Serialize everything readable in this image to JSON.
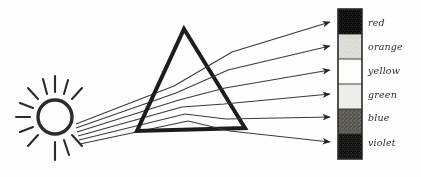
{
  "figure": {
    "background_color": "#fefefe",
    "ink_color": "#2b2b2b",
    "width": 421,
    "height": 177
  },
  "light_source": {
    "name": "sun",
    "center_x": 55,
    "center_y": 117,
    "radius": 17,
    "ray_count": 12
  },
  "prism": {
    "name": "triangular-prism",
    "apex_x": 184,
    "apex_y": 29,
    "base_left_x": 136,
    "base_right_x": 245,
    "base_y": 129
  },
  "incident_beam": {
    "label": "white light",
    "ray_count": 6,
    "origin_x": 80,
    "origin_y_top": 88,
    "origin_y_bottom": 123
  },
  "spectrum_bar": {
    "name": "spectrum-screen",
    "x": 338,
    "y": 9,
    "width": 24,
    "height": 150,
    "band_count": 6
  },
  "chart_data": {
    "type": "bar",
    "xlabel": "",
    "ylabel": "",
    "categories": [
      "red",
      "orange",
      "yellow",
      "green",
      "blue",
      "violet"
    ],
    "values": [
      25,
      25,
      25,
      25,
      25,
      25
    ],
    "legend_position": "right",
    "grid": false,
    "bands": [
      {
        "label": "red",
        "order": 1,
        "tone": "very-dark",
        "fill": "#1f1f1f",
        "stipple_opacity": 0.92,
        "band_top": 9,
        "band_height": 25,
        "arrow_tip_y": 22
      },
      {
        "label": "orange",
        "order": 2,
        "tone": "light",
        "fill": "#e0ddd8",
        "stipple_opacity": 0.35,
        "band_top": 34,
        "band_height": 25,
        "arrow_tip_y": 46
      },
      {
        "label": "yellow",
        "order": 3,
        "tone": "white",
        "fill": "#fdfdfb",
        "stipple_opacity": 0.04,
        "band_top": 59,
        "band_height": 25,
        "arrow_tip_y": 70
      },
      {
        "label": "green",
        "order": 4,
        "tone": "very-light",
        "fill": "#efedea",
        "stipple_opacity": 0.16,
        "band_top": 84,
        "band_height": 25,
        "arrow_tip_y": 94
      },
      {
        "label": "blue",
        "order": 5,
        "tone": "medium-dark",
        "fill": "#6a6660",
        "stipple_opacity": 0.72,
        "band_top": 109,
        "band_height": 25,
        "arrow_tip_y": 117
      },
      {
        "label": "violet",
        "order": 6,
        "tone": "dark",
        "fill": "#2a2724",
        "stipple_opacity": 0.88,
        "band_top": 134,
        "band_height": 25,
        "arrow_tip_y": 142
      }
    ],
    "label_x": 368
  }
}
